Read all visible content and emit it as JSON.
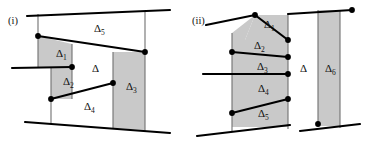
{
  "figure": {
    "kind": "geometry-diagram-pair",
    "background_color": "#ffffff",
    "line_color": "#000000",
    "shade_color": "#c9c9c9",
    "thin_line_color": "#707070",
    "vertex_color": "#000000"
  },
  "panels": [
    {
      "id": "panel-i",
      "tag": "(i)",
      "tag_x": 8,
      "tag_y": 24,
      "regions": [
        {
          "name": "delta-1",
          "base": "Δ",
          "sub": "1",
          "x": 56,
          "y": 57
        },
        {
          "name": "delta-2",
          "base": "Δ",
          "sub": "2",
          "x": 63,
          "y": 85
        },
        {
          "name": "delta-3",
          "base": "Δ",
          "sub": "3",
          "x": 126,
          "y": 90
        },
        {
          "name": "delta-4",
          "base": "Δ",
          "sub": "4",
          "x": 84,
          "y": 110
        },
        {
          "name": "delta-5",
          "base": "Δ",
          "sub": "5",
          "x": 94,
          "y": 32
        },
        {
          "name": "delta-main",
          "base": "Δ",
          "sub": "",
          "x": 92,
          "y": 72
        }
      ]
    },
    {
      "id": "panel-ii",
      "tag": "(ii)",
      "tag_x": 192,
      "tag_y": 24,
      "regions": [
        {
          "name": "delta-1",
          "base": "Δ",
          "sub": "1",
          "x": 264,
          "y": 28
        },
        {
          "name": "delta-2",
          "base": "Δ",
          "sub": "2",
          "x": 254,
          "y": 49
        },
        {
          "name": "delta-3",
          "base": "Δ",
          "sub": "3",
          "x": 257,
          "y": 70
        },
        {
          "name": "delta-4",
          "base": "Δ",
          "sub": "4",
          "x": 258,
          "y": 92
        },
        {
          "name": "delta-5",
          "base": "Δ",
          "sub": "5",
          "x": 258,
          "y": 117
        },
        {
          "name": "delta-6",
          "base": "Δ",
          "sub": "6",
          "x": 325,
          "y": 72
        },
        {
          "name": "delta-main",
          "base": "Δ",
          "sub": "",
          "x": 300,
          "y": 72
        }
      ]
    }
  ],
  "panel_i_geometry": {
    "shaded_polygons": [
      {
        "name": "delta-1-shape",
        "points": "38,36 38,68 72,68 72,44"
      },
      {
        "name": "delta-2-shape",
        "points": "51,68 51,99 72,99 72,68"
      },
      {
        "name": "delta-3-shape",
        "points": "113,52 113,128 145,130 145,52"
      }
    ],
    "thin_lines": [
      {
        "name": "left-vertical-thin",
        "x1": 38,
        "y1": 14,
        "x2": 38,
        "y2": 68
      },
      {
        "name": "mid-vertical-thin",
        "x1": 51,
        "y1": 68,
        "x2": 51,
        "y2": 124
      },
      {
        "name": "right-vertical-thin",
        "x1": 145,
        "y1": 12,
        "x2": 145,
        "y2": 131
      },
      {
        "name": "delta1-right-thin",
        "x1": 72,
        "y1": 44,
        "x2": 72,
        "y2": 99
      },
      {
        "name": "delta3-left-thin",
        "x1": 113,
        "y1": 52,
        "x2": 113,
        "y2": 128
      }
    ],
    "thick_lines": [
      {
        "name": "top-boundary",
        "x1": 27,
        "y1": 16,
        "x2": 170,
        "y2": 10
      },
      {
        "name": "bottom-boundary",
        "x1": 25,
        "y1": 122,
        "x2": 170,
        "y2": 133
      },
      {
        "name": "delta5-lower-edge",
        "x1": 38,
        "y1": 36,
        "x2": 145,
        "y2": 52
      },
      {
        "name": "delta1-lower-edge",
        "x1": 12,
        "y1": 68,
        "x2": 72,
        "y2": 67
      },
      {
        "name": "delta4-upper-edge",
        "x1": 51,
        "y1": 99,
        "x2": 113,
        "y2": 83
      }
    ],
    "vertices": [
      {
        "name": "vertex-a",
        "cx": 38,
        "cy": 36
      },
      {
        "name": "vertex-b",
        "cx": 145,
        "cy": 52
      },
      {
        "name": "vertex-c",
        "cx": 72,
        "cy": 67
      },
      {
        "name": "vertex-d",
        "cx": 51,
        "cy": 99
      },
      {
        "name": "vertex-e",
        "cx": 113,
        "cy": 83
      }
    ]
  },
  "panel_ii_geometry": {
    "shaded_polygons": [
      {
        "name": "delta-1-shape",
        "points": "255,15 288,15 288,40 245,40"
      },
      {
        "name": "delta-2-shape",
        "points": "232,33 255,15 245,40 288,40 288,57 232,57"
      },
      {
        "name": "delta-3-shape",
        "points": "232,52 288,57 288,74 232,74"
      },
      {
        "name": "delta-4-shape",
        "points": "232,74 288,74 288,99 232,99"
      },
      {
        "name": "delta-5-shape",
        "points": "232,99 288,99 288,127 232,127"
      },
      {
        "name": "delta-6-shape",
        "points": "318,10 340,10 340,126 318,126"
      }
    ],
    "thin_lines": [
      {
        "name": "left-vertical-thin",
        "x1": 232,
        "y1": 33,
        "x2": 232,
        "y2": 131
      },
      {
        "name": "inner-vertical-thin",
        "x1": 288,
        "y1": 14,
        "x2": 288,
        "y2": 129
      },
      {
        "name": "delta6-left-thin",
        "x1": 318,
        "y1": 10,
        "x2": 318,
        "y2": 126
      },
      {
        "name": "delta6-right-thin",
        "x1": 340,
        "y1": 10,
        "x2": 340,
        "y2": 128
      }
    ],
    "thick_lines": [
      {
        "name": "top-boundary",
        "x1": 288,
        "y1": 14,
        "x2": 352,
        "y2": 10
      },
      {
        "name": "delta1-upper-edge",
        "x1": 206,
        "y1": 25,
        "x2": 255,
        "y2": 15
      },
      {
        "name": "delta1-lower-edge",
        "x1": 255,
        "y1": 15,
        "x2": 288,
        "y2": 40
      },
      {
        "name": "delta2-lower-edge",
        "x1": 232,
        "y1": 52,
        "x2": 288,
        "y2": 57
      },
      {
        "name": "delta3-lower-edge",
        "x1": 203,
        "y1": 74,
        "x2": 288,
        "y2": 74
      },
      {
        "name": "delta4-lower-edge",
        "x1": 232,
        "y1": 113,
        "x2": 288,
        "y2": 99
      },
      {
        "name": "bottom-left-boundary",
        "x1": 197,
        "y1": 136,
        "x2": 290,
        "y2": 125
      },
      {
        "name": "bottom-right-boundary",
        "x1": 300,
        "y1": 131,
        "x2": 360,
        "y2": 124
      }
    ],
    "vertices": [
      {
        "name": "vertex-a",
        "cx": 255,
        "cy": 15
      },
      {
        "name": "vertex-b",
        "cx": 352,
        "cy": 10
      },
      {
        "name": "vertex-c",
        "cx": 288,
        "cy": 40
      },
      {
        "name": "vertex-d",
        "cx": 232,
        "cy": 52
      },
      {
        "name": "vertex-e",
        "cx": 288,
        "cy": 57
      },
      {
        "name": "vertex-f",
        "cx": 288,
        "cy": 74
      },
      {
        "name": "vertex-g",
        "cx": 288,
        "cy": 99
      },
      {
        "name": "vertex-h",
        "cx": 232,
        "cy": 113
      },
      {
        "name": "vertex-i",
        "cx": 318,
        "cy": 124
      }
    ]
  }
}
